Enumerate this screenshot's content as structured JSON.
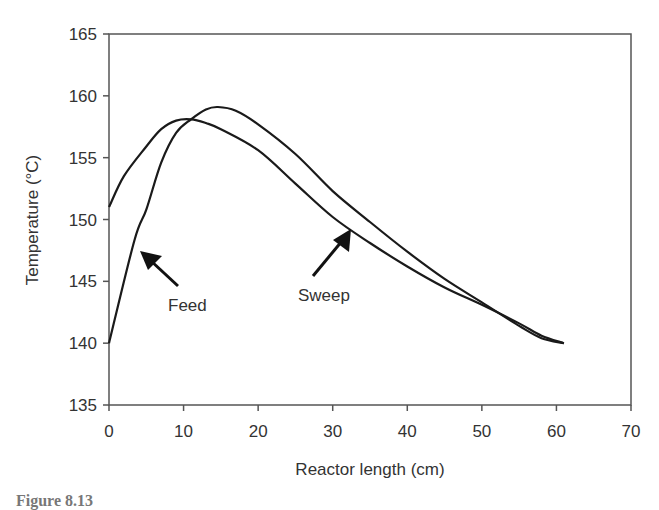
{
  "chart_data": {
    "type": "line",
    "title": "",
    "xlabel": "Reactor length (cm)",
    "ylabel": "Temperature (°C)",
    "xlim": [
      0,
      70
    ],
    "ylim": [
      135,
      165
    ],
    "xticks": [
      0,
      10,
      20,
      30,
      40,
      50,
      60,
      70
    ],
    "yticks": [
      135,
      140,
      145,
      150,
      155,
      160,
      165
    ],
    "grid": false,
    "legend": "none (curves labeled by arrow annotations)",
    "series": [
      {
        "name": "Feed",
        "x": [
          0,
          3.4,
          5,
          7,
          9,
          11,
          13,
          14.6,
          17,
          20,
          25,
          30,
          35,
          40,
          45,
          50,
          55,
          58,
          61
        ],
        "values": [
          140.0,
          148.3,
          150.8,
          154.6,
          157.0,
          158.1,
          158.9,
          159.1,
          158.8,
          157.7,
          155.3,
          152.3,
          149.8,
          147.4,
          145.2,
          143.3,
          141.4,
          140.4,
          140.0
        ]
      },
      {
        "name": "Sweep",
        "x": [
          0,
          2,
          5,
          7,
          9,
          11,
          13,
          15,
          20,
          25,
          30,
          35,
          40,
          45,
          50,
          55,
          58,
          61
        ],
        "values": [
          151.0,
          153.5,
          155.9,
          157.3,
          158.0,
          158.1,
          157.8,
          157.3,
          155.6,
          152.9,
          150.2,
          148.1,
          146.2,
          144.5,
          143.1,
          141.6,
          140.6,
          140.0
        ]
      }
    ],
    "annotations": [
      {
        "text": "Feed",
        "arrow_points_to": {
          "x": 4,
          "y": 147.5
        }
      },
      {
        "text": "Sweep",
        "arrow_points_to": {
          "x": 32.5,
          "y": 149.4
        }
      }
    ]
  },
  "labels": {
    "xlabel": "Reactor length (cm)",
    "ylabel": "Temperature (°C)",
    "feed": "Feed",
    "sweep": "Sweep"
  },
  "caption": "Figure 8.13"
}
